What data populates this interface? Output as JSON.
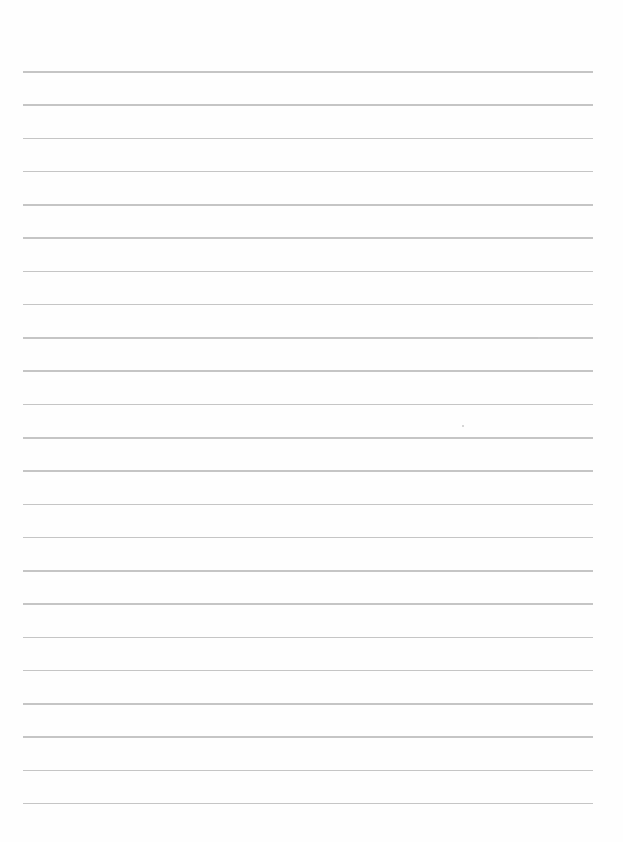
{
  "document": {
    "type": "lined-paper",
    "line_count": 23,
    "first_line_y": 71,
    "line_spacing": 33.27,
    "line_left": 23,
    "line_width": 570,
    "line_color": "#bfbfbf",
    "background_color": "#fefefe",
    "text": ""
  }
}
